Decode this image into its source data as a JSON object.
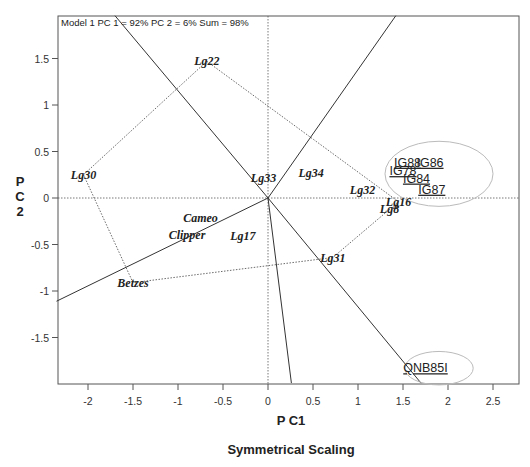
{
  "chart_data": {
    "type": "scatter",
    "subtype": "GGE biplot",
    "caption": "Model 1 PC 1 = 92% PC 2 = 6% Sum = 98%",
    "xlabel": "P C1",
    "ylabel": "P C 2",
    "ylabel_lines": [
      "P",
      "C",
      "2"
    ],
    "subtitle": "Symmetrical Scaling",
    "xlim": [
      -2.35,
      2.78
    ],
    "ylim": [
      -1.99,
      1.96
    ],
    "x_ticks": [
      "-2",
      "-1.5",
      "-1",
      "-0.5",
      "0",
      "0.5",
      "1",
      "1.5",
      "2",
      "2.5"
    ],
    "y_ticks": [
      "1.5",
      "1",
      "0.5",
      "0",
      "-0.5",
      "-1",
      "-1.5"
    ],
    "x_tick_values": [
      -2,
      -1.5,
      -1,
      -0.5,
      0,
      0.5,
      1,
      1.5,
      2,
      2.5
    ],
    "y_tick_values": [
      1.5,
      1,
      0.5,
      0,
      -0.5,
      -1,
      -1.5
    ],
    "grid": false,
    "genotypes": [
      {
        "label": "Lg22",
        "x": -0.68,
        "y": 1.47
      },
      {
        "label": "Lg30",
        "x": -2.05,
        "y": 0.25
      },
      {
        "label": "Lg33",
        "x": -0.05,
        "y": 0.22
      },
      {
        "label": "Lg34",
        "x": 0.48,
        "y": 0.27
      },
      {
        "label": "Lg32",
        "x": 1.05,
        "y": 0.09
      },
      {
        "label": "Lg16",
        "x": 1.45,
        "y": -0.04
      },
      {
        "label": "Lg8",
        "x": 1.35,
        "y": -0.12
      },
      {
        "label": "Cameo",
        "x": -0.75,
        "y": -0.21
      },
      {
        "label": "Clipper",
        "x": -0.9,
        "y": -0.4
      },
      {
        "label": "Lg17",
        "x": -0.28,
        "y": -0.41
      },
      {
        "label": "Lg31",
        "x": 0.72,
        "y": -0.64
      },
      {
        "label": "Betzes",
        "x": -1.5,
        "y": -0.91
      }
    ],
    "environments": [
      {
        "label": "IG88",
        "x": 1.55,
        "y": 0.39
      },
      {
        "label": "IG86",
        "x": 1.8,
        "y": 0.39
      },
      {
        "label": "IG78",
        "x": 1.5,
        "y": 0.3
      },
      {
        "label": "IG84",
        "x": 1.65,
        "y": 0.22
      },
      {
        "label": "IG87",
        "x": 1.82,
        "y": 0.1
      },
      {
        "label": "QNB85I",
        "x": 1.75,
        "y": -1.82
      }
    ],
    "polygon_vertices": [
      "Lg22",
      "Lg16",
      "Lg31",
      "Betzes",
      "Lg30",
      "Lg22"
    ],
    "sector_rays": [
      {
        "from": [
          0,
          0
        ],
        "to": [
          -1.7,
          1.96
        ]
      },
      {
        "from": [
          0,
          0
        ],
        "to": [
          1.7,
          -1.99
        ]
      },
      {
        "from": [
          0,
          0
        ],
        "to": [
          1.42,
          1.96
        ]
      },
      {
        "from": [
          0,
          0
        ],
        "to": [
          0.26,
          -1.99
        ]
      },
      {
        "from": [
          0,
          0
        ],
        "to": [
          -2.35,
          -1.11
        ]
      }
    ],
    "mega_environment_ellipses": [
      {
        "cx": 1.9,
        "cy": 0.26,
        "rx": 0.6,
        "ry": 0.35
      },
      {
        "cx": 1.9,
        "cy": -1.83,
        "rx": 0.38,
        "ry": 0.18
      }
    ]
  }
}
